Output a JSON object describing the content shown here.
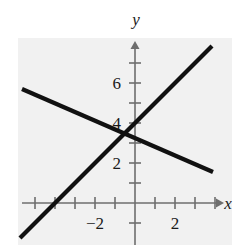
{
  "figure": {
    "name": "linear-system-graph",
    "background_color": "#ffffff",
    "plot_tint_color": "#f1f1f1",
    "axis_color": "#6e6e6e",
    "line_color": "#111111",
    "label_color": "#1a1a1a"
  },
  "chart_data": {
    "type": "line",
    "title": "",
    "xlabel": "x",
    "ylabel": "y",
    "grid": false,
    "legend": "none",
    "xlim": [
      -5.75,
      4.35
    ],
    "ylim": [
      -2.0,
      8.05
    ],
    "x_tick_values": [
      -5,
      -4,
      -3,
      -2,
      -1,
      1,
      2,
      3,
      4
    ],
    "x_tick_labels": [
      "",
      "",
      "",
      "-2",
      "",
      "",
      "2",
      "",
      ""
    ],
    "x_labeled_ticks": [
      {
        "value": -2,
        "label": "−2"
      },
      {
        "value": 2,
        "label": "2"
      }
    ],
    "y_tick_values": [
      1,
      2,
      3,
      4,
      5,
      6,
      7
    ],
    "y_labeled_ticks": [
      {
        "value": 2,
        "label": "2"
      },
      {
        "value": 4,
        "label": "4"
      },
      {
        "value": 6,
        "label": "6"
      }
    ],
    "x_axis_arrow": true,
    "y_axis_arrow": true,
    "series": [
      {
        "name": "rising-line",
        "slope": 1,
        "intercept": 4,
        "x_start": -5.75,
        "x_end": 3.85,
        "points": [
          [
            -5.75,
            -1.75
          ],
          [
            3.85,
            7.85
          ]
        ]
      },
      {
        "name": "falling-line",
        "slope": -0.4333,
        "intercept": 3.25,
        "x_start": -5.65,
        "x_end": 3.9,
        "points": [
          [
            -5.65,
            5.7
          ],
          [
            3.9,
            1.55
          ]
        ]
      }
    ],
    "intersection": {
      "x": -0.6,
      "y": 3.5
    }
  }
}
